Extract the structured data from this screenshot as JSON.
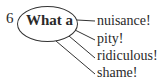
{
  "exercise": {
    "number": "6",
    "stem": "What a",
    "endings": [
      {
        "text": "nuisance!"
      },
      {
        "text": "pity!"
      },
      {
        "text": "ridiculous!"
      },
      {
        "text": "shame!"
      }
    ]
  },
  "colors": {
    "text": "#2a2a2a",
    "lines": "#333333"
  }
}
